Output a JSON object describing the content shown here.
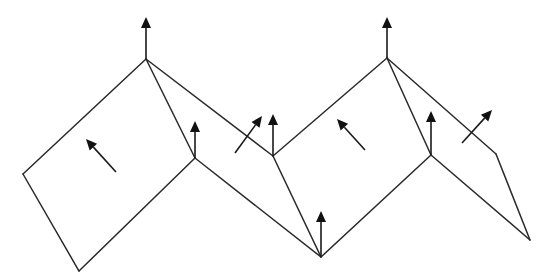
{
  "diagram": {
    "colors": {
      "line": "#2a2a2a",
      "arrow": "#111111",
      "background": "#ffffff"
    },
    "vertices": {
      "A": [
        23,
        174
      ],
      "B": [
        79,
        271
      ],
      "C": [
        146,
        59
      ],
      "D": [
        195,
        158
      ],
      "E": [
        273,
        156
      ],
      "F": [
        321,
        257
      ],
      "G": [
        387,
        58
      ],
      "H": [
        431,
        155
      ],
      "I": [
        496,
        154
      ],
      "J": [
        530,
        240
      ]
    },
    "edges": [
      [
        "A",
        "C"
      ],
      [
        "A",
        "B"
      ],
      [
        "B",
        "D"
      ],
      [
        "C",
        "D"
      ],
      [
        "C",
        "E"
      ],
      [
        "D",
        "F"
      ],
      [
        "E",
        "F"
      ],
      [
        "E",
        "G"
      ],
      [
        "F",
        "H"
      ],
      [
        "G",
        "H"
      ],
      [
        "G",
        "I"
      ],
      [
        "H",
        "J"
      ],
      [
        "I",
        "J"
      ]
    ],
    "vertex_normals": [
      {
        "at": "C",
        "from": [
          146,
          59
        ],
        "to": [
          146,
          17
        ]
      },
      {
        "at": "D",
        "from": [
          195,
          158
        ],
        "to": [
          195,
          121
        ]
      },
      {
        "at": "E",
        "from": [
          273,
          156
        ],
        "to": [
          273,
          114
        ]
      },
      {
        "at": "F",
        "from": [
          321,
          257
        ],
        "to": [
          321,
          211
        ]
      },
      {
        "at": "G",
        "from": [
          387,
          58
        ],
        "to": [
          387,
          17
        ]
      },
      {
        "at": "H",
        "from": [
          431,
          155
        ],
        "to": [
          431,
          111
        ]
      }
    ],
    "face_normals": [
      {
        "face": "A-B-D-C",
        "from": [
          116,
          172
        ],
        "to": [
          86,
          139
        ]
      },
      {
        "face": "C-D-F-E",
        "from": [
          235,
          153
        ],
        "to": [
          262,
          116
        ]
      },
      {
        "face": "E-F-H-G",
        "from": [
          365,
          150
        ],
        "to": [
          337,
          119
        ]
      },
      {
        "face": "G-H-J-I",
        "from": [
          462,
          143
        ],
        "to": [
          492,
          110
        ]
      }
    ]
  }
}
